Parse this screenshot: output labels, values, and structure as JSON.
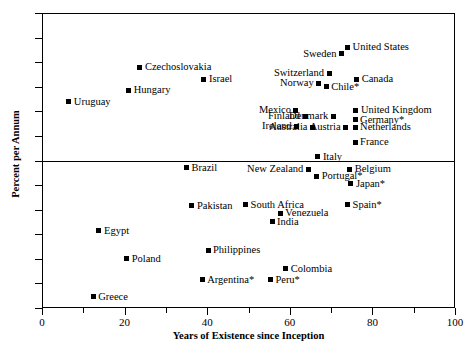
{
  "chart_data": {
    "type": "scatter",
    "title": "",
    "xlabel": "Years of Existence since Inception",
    "ylabel": "Percent per Annum",
    "xlim": [
      0,
      100
    ],
    "ylim": [
      -6,
      6
    ],
    "xticks": [
      0,
      20,
      40,
      60,
      80,
      100
    ],
    "xticks_minor": [
      10,
      30,
      50,
      70,
      90
    ],
    "yticks": [
      6,
      5,
      4,
      3,
      2,
      1,
      0,
      -1,
      -2,
      -3,
      -4,
      -5,
      -6
    ],
    "ytick_labels": [
      "6",
      "5",
      "4",
      "3",
      "2",
      "1",
      "0",
      "−1",
      "−2",
      "−3",
      "−4",
      "−5",
      "−6"
    ],
    "grid": false,
    "legend": "none",
    "zero_line": true,
    "marker": "filled-square",
    "marker_color": "#000000",
    "points": [
      {
        "label": "Uruguay",
        "x": 6.5,
        "y": 2.4,
        "label_side": "right"
      },
      {
        "label": "Hungary",
        "x": 21.0,
        "y": 2.85,
        "label_side": "right"
      },
      {
        "label": "Czechoslovakia",
        "x": 23.7,
        "y": 3.8,
        "label_side": "right"
      },
      {
        "label": "Israel",
        "x": 39.2,
        "y": 3.3,
        "label_side": "right"
      },
      {
        "label": "Sweden",
        "x": 72.5,
        "y": 4.35,
        "label_side": "left"
      },
      {
        "label": "United States",
        "x": 74.0,
        "y": 4.6,
        "label_side": "right"
      },
      {
        "label": "Switzerland",
        "x": 69.5,
        "y": 3.55,
        "label_side": "left"
      },
      {
        "label": "Canada",
        "x": 76.2,
        "y": 3.3,
        "label_side": "right"
      },
      {
        "label": "Norway",
        "x": 67.0,
        "y": 3.15,
        "label_side": "left"
      },
      {
        "label": "Chile*",
        "x": 68.8,
        "y": 3.0,
        "label_side": "right"
      },
      {
        "label": "Mexico",
        "x": 61.5,
        "y": 2.05,
        "label_side": "left"
      },
      {
        "label": "United Kingdom",
        "x": 76.0,
        "y": 2.05,
        "label_side": "right"
      },
      {
        "label": "Finland",
        "x": 63.7,
        "y": 1.8,
        "label_side": "left"
      },
      {
        "label": "Denmark",
        "x": 70.5,
        "y": 1.8,
        "label_side": "left"
      },
      {
        "label": "Germany*",
        "x": 75.8,
        "y": 1.65,
        "label_side": "right"
      },
      {
        "label": "Ireland",
        "x": 61.7,
        "y": 1.4,
        "label_side": "left"
      },
      {
        "label": "Austria",
        "x": 73.5,
        "y": 1.35,
        "label_side": "left"
      },
      {
        "label": "Netherlands",
        "x": 75.8,
        "y": 1.35,
        "label_side": "right"
      },
      {
        "label": "Australia",
        "x": 65.5,
        "y": 1.35,
        "label_side": "left"
      },
      {
        "label": "France",
        "x": 75.8,
        "y": 0.75,
        "label_side": "right"
      },
      {
        "label": "Italy",
        "x": 66.8,
        "y": 0.15,
        "label_side": "right"
      },
      {
        "label": "Brazil",
        "x": 35.0,
        "y": -0.3,
        "label_side": "right"
      },
      {
        "label": "New Zealand",
        "x": 64.5,
        "y": -0.35,
        "label_side": "left"
      },
      {
        "label": "Belgium",
        "x": 74.5,
        "y": -0.35,
        "label_side": "right"
      },
      {
        "label": "Portugal*",
        "x": 66.5,
        "y": -0.65,
        "label_side": "right"
      },
      {
        "label": "Japan*",
        "x": 74.8,
        "y": -0.95,
        "label_side": "right"
      },
      {
        "label": "Pakistan",
        "x": 36.3,
        "y": -1.85,
        "label_side": "right"
      },
      {
        "label": "South Africa",
        "x": 49.3,
        "y": -1.8,
        "label_side": "right"
      },
      {
        "label": "Spain*",
        "x": 74.0,
        "y": -1.8,
        "label_side": "right"
      },
      {
        "label": "Venezuela",
        "x": 57.7,
        "y": -2.15,
        "label_side": "right"
      },
      {
        "label": "India",
        "x": 55.7,
        "y": -2.5,
        "label_side": "right"
      },
      {
        "label": "Egypt",
        "x": 13.8,
        "y": -2.85,
        "label_side": "right"
      },
      {
        "label": "Philippines",
        "x": 40.2,
        "y": -3.65,
        "label_side": "right"
      },
      {
        "label": "Poland",
        "x": 20.5,
        "y": -4.0,
        "label_side": "right"
      },
      {
        "label": "Colombia",
        "x": 59.0,
        "y": -4.4,
        "label_side": "right"
      },
      {
        "label": "Argentina*",
        "x": 38.8,
        "y": -4.85,
        "label_side": "right"
      },
      {
        "label": "Peru*",
        "x": 55.3,
        "y": -4.85,
        "label_side": "right"
      },
      {
        "label": "Greece",
        "x": 12.4,
        "y": -5.55,
        "label_side": "right"
      }
    ]
  }
}
